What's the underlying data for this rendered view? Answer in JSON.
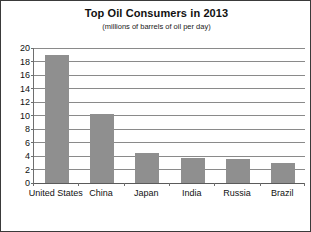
{
  "chart_data": {
    "type": "bar",
    "title": "Top Oil Consumers in 2013",
    "subtitle": "(millions of barrels of oil per day)",
    "xlabel": "",
    "ylabel": "",
    "categories": [
      "United States",
      "China",
      "Japan",
      "India",
      "Russia",
      "Brazil"
    ],
    "values": [
      19.0,
      10.2,
      4.5,
      3.7,
      3.5,
      3.0
    ],
    "ylim": [
      0,
      20
    ],
    "ytick_labels": [
      "0",
      "2",
      "4",
      "6",
      "8",
      "10",
      "12",
      "14",
      "16",
      "18",
      "20"
    ],
    "ytick_values": [
      0,
      2,
      4,
      6,
      8,
      10,
      12,
      14,
      16,
      18,
      20
    ],
    "grid": true,
    "legend": false,
    "bar_color": "#8f8f8f",
    "grid_color": "#8a8a8a",
    "axis_color": "#5a5a5a",
    "background_color": "#ffffff",
    "border_color": "#3a3a3a"
  }
}
